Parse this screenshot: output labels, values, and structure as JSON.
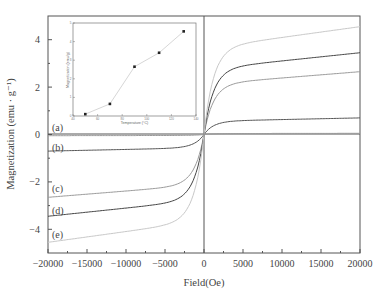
{
  "chart_data": [
    {
      "type": "line",
      "title": "",
      "xlabel": "Field(Oe)",
      "ylabel": "Magnetization (emu · g⁻¹)",
      "xlim": [
        -20000,
        20000
      ],
      "ylim": [
        -5,
        5
      ],
      "x_ticks": [
        -20000,
        -15000,
        -10000,
        -5000,
        0,
        5000,
        10000,
        15000,
        20000
      ],
      "y_ticks": [
        -4,
        -2,
        0,
        2,
        4
      ],
      "grid": false,
      "legend": "inline labels (a)-(e) at left",
      "series": [
        {
          "name": "(a)",
          "saturation": 0.05,
          "color": "#9a9a9a"
        },
        {
          "name": "(b)",
          "saturation": 0.7,
          "color": "#555555"
        },
        {
          "name": "(c)",
          "saturation": 2.65,
          "color": "#9a9a9a"
        },
        {
          "name": "(d)",
          "saturation": 3.45,
          "color": "#444444"
        },
        {
          "name": "(e)",
          "saturation": 4.55,
          "color": "#c8c8c8"
        }
      ],
      "annotations": [
        "(a)",
        "(b)",
        "(c)",
        "(d)",
        "(e)"
      ]
    },
    {
      "type": "line",
      "title": "inset",
      "xlabel": "Temperature (°C)",
      "ylabel": "Magnetization (emu/g)",
      "xlim": [
        40,
        140
      ],
      "ylim": [
        0,
        5
      ],
      "x_ticks": [
        40,
        60,
        80,
        100,
        120,
        140
      ],
      "y_ticks": [
        0,
        1,
        2,
        3,
        4,
        5
      ],
      "x": [
        50,
        70,
        90,
        110,
        130
      ],
      "values": [
        0.1,
        0.65,
        2.65,
        3.4,
        4.55
      ],
      "markers": "square"
    }
  ],
  "labels": {
    "xlabel": "Field(Oe)",
    "ylabel": "Magnetization (emu · g⁻¹)",
    "x_ticks": [
      "−20000",
      "−15000",
      "−10000",
      "−5000",
      "0",
      "5000",
      "10000",
      "15000",
      "20000"
    ],
    "y_ticks": [
      "4",
      "2",
      "0",
      "−2",
      "−4"
    ],
    "curves": [
      "(a)",
      "(b)",
      "(c)",
      "(d)",
      "(e)"
    ],
    "inset_xlabel": "Temperature (°C)",
    "inset_ylabel": "Magnetization (emu/g)",
    "inset_x_ticks": [
      "40",
      "60",
      "80",
      "100",
      "120",
      "140"
    ],
    "inset_y_ticks": [
      "0",
      "1",
      "2",
      "3",
      "4",
      "5"
    ]
  }
}
